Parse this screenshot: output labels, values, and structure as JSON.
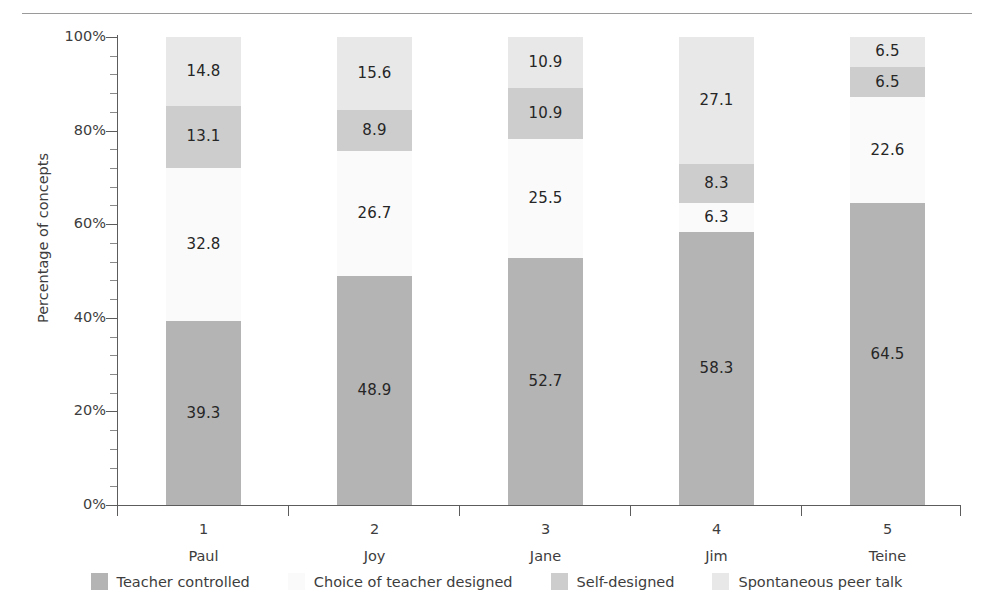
{
  "figure": {
    "clipped_header_text": "",
    "ylabel": "Percentage of concepts"
  },
  "chart_data": {
    "type": "bar",
    "subtype": "stacked-percentage",
    "title": "",
    "xlabel": "",
    "ylabel": "Percentage of concepts",
    "ylim": [
      0,
      100
    ],
    "ytick_labels": [
      "0%",
      "20%",
      "40%",
      "60%",
      "80%",
      "100%"
    ],
    "ytick_values": [
      0,
      20,
      40,
      60,
      80,
      100
    ],
    "yminor_step": 4,
    "grid": false,
    "legend_position": "bottom",
    "categories": [
      "1",
      "2",
      "3",
      "4",
      "5"
    ],
    "category_names": [
      "Paul",
      "Joy",
      "Jane",
      "Jim",
      "Teine"
    ],
    "series": [
      {
        "name": "Teacher controlled",
        "color": "#b4b4b4",
        "values": [
          39.3,
          48.9,
          52.7,
          58.3,
          64.5
        ],
        "labels": [
          "39.3",
          "48.9",
          "52.7",
          "58.3",
          "64.5"
        ]
      },
      {
        "name": "Choice of teacher designed",
        "color": "#fafafa",
        "values": [
          32.8,
          26.7,
          25.5,
          6.3,
          22.6
        ],
        "labels": [
          "32.8",
          "26.7",
          "25.5",
          "6.3",
          "22.6"
        ]
      },
      {
        "name": "Self-designed",
        "color": "#cdcdcd",
        "values": [
          13.1,
          8.9,
          10.9,
          8.3,
          6.5
        ],
        "labels": [
          "13.1",
          "8.9",
          "10.9",
          "8.3",
          "6.5"
        ]
      },
      {
        "name": "Spontaneous peer talk",
        "color": "#e8e8e8",
        "values": [
          14.8,
          15.6,
          10.9,
          27.1,
          6.5
        ],
        "labels": [
          "14.8",
          "15.6",
          "10.9",
          "27.1",
          "6.5"
        ]
      }
    ]
  },
  "legend": {
    "items": [
      {
        "label": "Teacher controlled",
        "color": "#b4b4b4"
      },
      {
        "label": "Choice of teacher designed",
        "color": "#fafafa"
      },
      {
        "label": "Self-designed",
        "color": "#cdcdcd"
      },
      {
        "label": "Spontaneous peer talk",
        "color": "#e8e8e8"
      }
    ]
  }
}
